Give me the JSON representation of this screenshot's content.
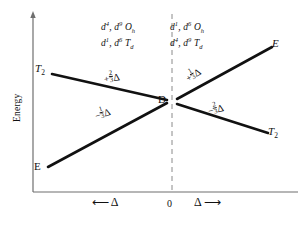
{
  "figure": {
    "kind": "orgel-diagram",
    "axis": {
      "y_label": "Energy",
      "x_zero_label": "0",
      "x_left_symbol": "Δ",
      "x_right_symbol": "Δ",
      "x_left_arrow": "⟵",
      "x_right_arrow": "⟶"
    },
    "center_term": "D",
    "terms": {
      "upper_left": {
        "symbol": "T",
        "subscript": "2"
      },
      "lower_left": {
        "symbol": "E",
        "subscript": ""
      },
      "upper_right": {
        "symbol": "E",
        "subscript": ""
      },
      "lower_right": {
        "symbol": "T",
        "subscript": "2"
      }
    },
    "configurations": {
      "left_top": {
        "c1": "d",
        "e1": "4",
        "c2": "d",
        "e2": "9",
        "symmetry": "O",
        "sym_sub": "h"
      },
      "left_bottom": {
        "c1": "d",
        "e1": "1",
        "c2": "d",
        "e2": "6",
        "symmetry": "T",
        "sym_sub": "d"
      },
      "right_top": {
        "c1": "d",
        "e1": "1",
        "c2": "d",
        "e2": "6",
        "symmetry": "O",
        "sym_sub": "h"
      },
      "right_bottom": {
        "c1": "d",
        "e1": "4",
        "c2": "d",
        "e2": "9",
        "symmetry": "T",
        "sym_sub": "d"
      }
    },
    "slopes": {
      "upper_left": {
        "sign": "+",
        "num": "2",
        "den": "3",
        "delta": "Δ"
      },
      "lower_left": {
        "sign": "−",
        "num": "1",
        "den": "3",
        "delta": "Δ"
      },
      "upper_right": {
        "sign": "+",
        "num": "1",
        "den": "3",
        "delta": "Δ"
      },
      "lower_right": {
        "sign": "−",
        "num": "2",
        "den": "3",
        "delta": "Δ"
      }
    },
    "colors": {
      "line": "#111111",
      "axis": "#6f6f6f",
      "dashed": "#8a8a8a",
      "background": "#ffffff"
    }
  }
}
